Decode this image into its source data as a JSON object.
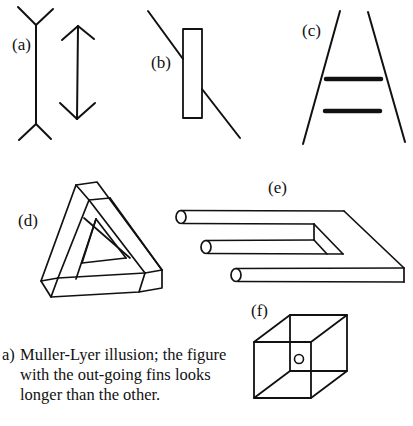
{
  "figures": [
    {
      "id": "a",
      "label": "(a)",
      "name": "Muller-Lyer illusion"
    },
    {
      "id": "b",
      "label": "(b)",
      "name": "Poggendorff illusion"
    },
    {
      "id": "c",
      "label": "(c)",
      "name": "Ponzo illusion"
    },
    {
      "id": "d",
      "label": "(d)",
      "name": "Impossible triangle"
    },
    {
      "id": "e",
      "label": "(e)",
      "name": "Impossible fork"
    },
    {
      "id": "f",
      "label": "(f)",
      "name": "Necker cube"
    }
  ],
  "caption": {
    "marker": "a)",
    "text": "Muller-Lyer illusion; the figure with the out-going fins looks longer than the other."
  },
  "colors": {
    "stroke": "#111111",
    "background": "#ffffff"
  }
}
